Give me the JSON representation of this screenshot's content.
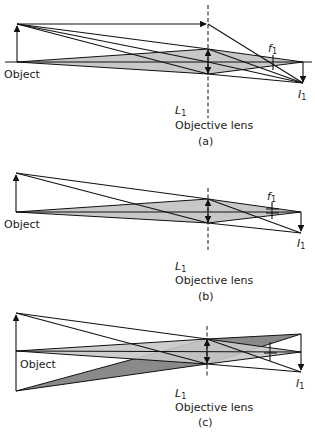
{
  "figure": {
    "panels": [
      {
        "id": "a",
        "caption": "(a)",
        "object_label": "Object",
        "lens_symbol": "L",
        "lens_subscript": "1",
        "lens_label": "Objective lens",
        "focal_symbol": "f",
        "focal_subscript": "1",
        "image_symbol": "I",
        "image_subscript": "1"
      },
      {
        "id": "b",
        "caption": "(b)",
        "object_label": "Object",
        "lens_symbol": "L",
        "lens_subscript": "1",
        "lens_label": "Objective lens",
        "focal_symbol": "f",
        "focal_subscript": "1",
        "image_symbol": "I",
        "image_subscript": "1"
      },
      {
        "id": "c",
        "caption": "(c)",
        "object_label": "Object",
        "lens_symbol": "L",
        "lens_subscript": "1",
        "lens_label": "Objective lens",
        "focal_symbol": "f",
        "focal_subscript": "1",
        "image_symbol": "I",
        "image_subscript": "1"
      }
    ],
    "colors": {
      "light_cone": "#c8c8c8",
      "dark_cone": "#8a8a8a",
      "mid_cone": "#a9a9a9",
      "line": "#111111"
    }
  }
}
